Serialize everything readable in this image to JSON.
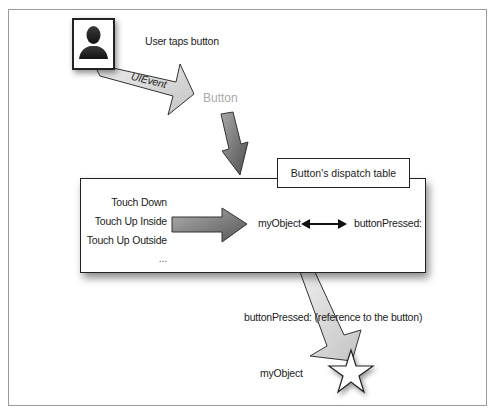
{
  "diagram": {
    "actor_label": "User taps button",
    "event_label": "UIEvent",
    "button_label": "Button",
    "dispatch_table": {
      "title": "Button's dispatch table",
      "events": [
        "Touch Down",
        "Touch Up Inside",
        "Touch Up Outside",
        "..."
      ],
      "target": "myObject",
      "action": "buttonPressed:"
    },
    "message_label": "buttonPressed: (reference to the button)",
    "receiver_label": "myObject"
  },
  "icons": {
    "actor": "user-silhouette-icon",
    "receiver": "star-icon",
    "link": "double-arrow-icon"
  },
  "colors": {
    "frame_border": "#9a9a9a",
    "box_border": "#222222",
    "light_arrow_fill": "#d9d9d9",
    "dark_arrow_fill": "#7a7a7a",
    "button_text": "#aaaaaa",
    "text": "#222222"
  }
}
